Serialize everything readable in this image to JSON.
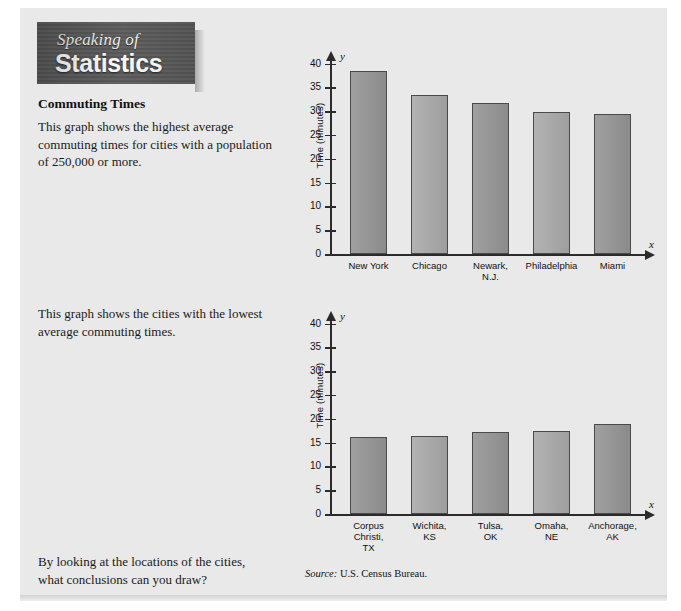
{
  "banner": {
    "line1": "Speaking of",
    "line2": "Statistics"
  },
  "article": {
    "heading": "Commuting Times",
    "paragraph1": "This graph shows the highest average commuting times for cities with a population of 250,000 or more.",
    "paragraph2": "This graph shows the cities with the lowest average commuting times.",
    "paragraph3": "By looking at the locations of the cities, what conclusions can you draw?"
  },
  "source": {
    "label": "Source:",
    "text": "U.S. Census Bureau."
  },
  "axis": {
    "x_symbol": "x",
    "y_symbol": "y",
    "y_title": "Time (minutes)",
    "ticks": [
      "0",
      "5",
      "10",
      "15",
      "20",
      "25",
      "30",
      "35",
      "40"
    ]
  },
  "colors": {
    "panel_background": "#e9e9e9",
    "bar_fill": "#9b9b9b",
    "bar_fill_light": "#a8a8a8",
    "bar_outline": "#4a4a4a",
    "axis": "#2b2b2b",
    "banner_background": "#5d5d5d",
    "banner_text": "#ffffff"
  },
  "chart_data": [
    {
      "type": "bar",
      "title": "Highest average commuting times",
      "categories": [
        "New York",
        "Chicago",
        "Newark,\nN.J.",
        "Philadelphia",
        "Miami"
      ],
      "category_lines": [
        [
          "New York"
        ],
        [
          "Chicago"
        ],
        [
          "Newark,",
          "N.J."
        ],
        [
          "Philadelphia"
        ],
        [
          "Miami"
        ]
      ],
      "values": [
        38.5,
        33.3,
        31.8,
        29.8,
        29.5
      ],
      "xlabel": "x",
      "ylabel": "Time (minutes)",
      "ylim": [
        0,
        42
      ],
      "yticks": [
        0,
        5,
        10,
        15,
        20,
        25,
        30,
        35,
        40
      ],
      "grid": false,
      "legend": "none"
    },
    {
      "type": "bar",
      "title": "Lowest average commuting times",
      "categories": [
        "Corpus\nChristi,\nTX",
        "Wichita,\nKS",
        "Tulsa,\nOK",
        "Omaha,\nNE",
        "Anchorage,\nAK"
      ],
      "category_lines": [
        [
          "Corpus",
          "Christi,",
          "TX"
        ],
        [
          "Wichita,",
          "KS"
        ],
        [
          "Tulsa,",
          "OK"
        ],
        [
          "Omaha,",
          "NE"
        ],
        [
          "Anchorage,",
          "AK"
        ]
      ],
      "values": [
        16.1,
        16.4,
        17.2,
        17.5,
        18.8
      ],
      "xlabel": "x",
      "ylabel": "Time (minutes)",
      "ylim": [
        0,
        42
      ],
      "yticks": [
        0,
        5,
        10,
        15,
        20,
        25,
        30,
        35,
        40
      ],
      "grid": false,
      "legend": "none"
    }
  ]
}
